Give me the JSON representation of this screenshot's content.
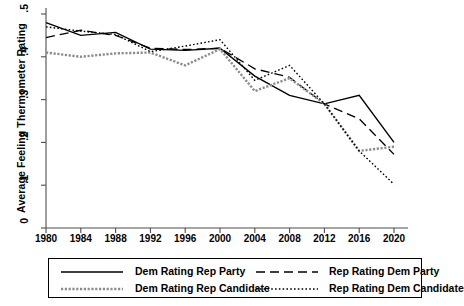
{
  "chart_data": {
    "type": "line",
    "title": "",
    "xlabel": "",
    "ylabel": "Average Feeling Thermometer Rating",
    "x": [
      1980,
      1984,
      1988,
      1992,
      1996,
      2000,
      2004,
      2008,
      2012,
      2016,
      2020
    ],
    "xticklabels": [
      "1980",
      "1984",
      "1988",
      "1992",
      "1996",
      "2000",
      "2004",
      "2008",
      "2012",
      "2016",
      "2020"
    ],
    "yticklabels": [
      "0",
      ".1",
      ".2",
      ".3",
      ".4",
      ".5"
    ],
    "ytickvalues": [
      0,
      0.1,
      0.2,
      0.3,
      0.4,
      0.5
    ],
    "xlim": [
      1980,
      2020
    ],
    "ylim": [
      0,
      0.5
    ],
    "grid": false,
    "legend_position": "below",
    "series": [
      {
        "name": "Dem Rating Rep Party",
        "style": "solid",
        "color": "#000000",
        "values": [
          0.48,
          0.45,
          0.457,
          0.418,
          0.415,
          0.42,
          0.355,
          0.31,
          0.29,
          0.31,
          0.2
        ]
      },
      {
        "name": "Rep Rating Dem Party",
        "style": "dashed",
        "color": "#000000",
        "values": [
          0.445,
          0.462,
          0.45,
          0.42,
          0.417,
          0.42,
          0.372,
          0.352,
          0.29,
          0.255,
          0.172
        ]
      },
      {
        "name": "Dem Rating Rep Candidate",
        "style": "dotted-thick",
        "color": "#8c8c8c",
        "values": [
          0.41,
          0.4,
          0.408,
          0.41,
          0.38,
          0.418,
          0.32,
          0.35,
          0.29,
          0.18,
          0.19
        ]
      },
      {
        "name": "Rep Rating Dem Candidate",
        "style": "dotted-fine",
        "color": "#000000",
        "values": [
          0.47,
          0.46,
          0.452,
          0.412,
          0.425,
          0.44,
          0.345,
          0.38,
          0.29,
          0.18,
          0.102
        ]
      }
    ]
  },
  "axis": {
    "ylabel": "Average Feeling Thermometer Rating"
  },
  "legend": {
    "entries": [
      {
        "label": "Dem Rating Rep Party"
      },
      {
        "label": "Rep Rating Dem Party"
      },
      {
        "label": "Dem Rating Rep Candidate"
      },
      {
        "label": "Rep Rating Dem Candidate"
      }
    ]
  }
}
